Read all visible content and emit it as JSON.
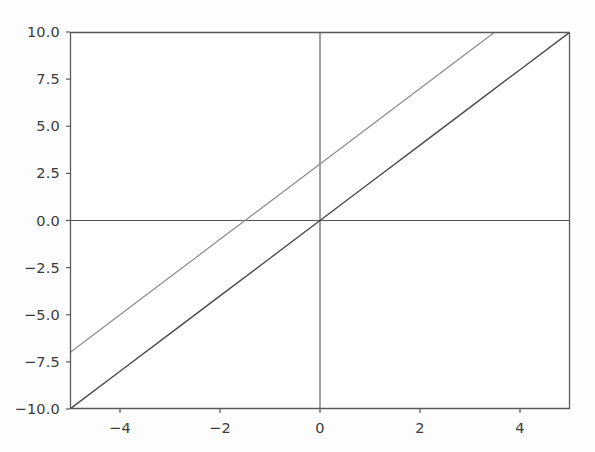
{
  "figure": {
    "background_color": "#fdfdfd",
    "plot_background_color": "#ffffff",
    "width_px": 595,
    "height_px": 452
  },
  "chart_data": {
    "type": "line",
    "title": "",
    "subtitle": "",
    "xlabel": "",
    "ylabel": "",
    "xlim": [
      -5,
      5
    ],
    "ylim": [
      -10,
      10
    ],
    "xticks": [
      -4,
      -2,
      0,
      2,
      4
    ],
    "xtick_labels": [
      "−4",
      "−2",
      "0",
      "2",
      "4"
    ],
    "yticks": [
      10,
      7.5,
      5,
      2.5,
      0,
      -2.5,
      -5,
      -7.5,
      -10
    ],
    "ytick_labels": [
      "10.0",
      "7.5",
      "5.0",
      "2.5",
      "0.0",
      "−2.5",
      "−5.0",
      "−7.5",
      "−10.0"
    ],
    "grid": false,
    "legend": null,
    "legend_position": "none",
    "axis_lines": {
      "vertical_at_x": 0,
      "horizontal_at_y": 0,
      "color": "#555555"
    },
    "series": [
      {
        "name": "y = 2x",
        "color": "#4a4a4a",
        "linewidth": 1.4,
        "equation": "y = 2*x",
        "slope": 2,
        "intercept": 0,
        "x": [
          -5,
          -4,
          -3,
          -2,
          -1,
          0,
          1,
          2,
          3,
          4,
          5
        ],
        "values": [
          -10,
          -8,
          -6,
          -4,
          -2,
          0,
          2,
          4,
          6,
          8,
          10
        ]
      },
      {
        "name": "y = 2x + 3",
        "color": "#8c8c8c",
        "linewidth": 1.2,
        "equation": "y = 2*x + 3",
        "slope": 2,
        "intercept": 3,
        "x": [
          -5,
          -4,
          -3,
          -2,
          -1,
          0,
          1,
          2,
          3,
          3.5
        ],
        "values": [
          -7,
          -5,
          -3,
          -1,
          1,
          3,
          5,
          7,
          9,
          10
        ]
      }
    ],
    "annotations": []
  },
  "axes_geometry": {
    "left_px": 70,
    "right_px": 570,
    "top_px": 32,
    "bottom_px": 409,
    "spine_color": "#5a5a5a",
    "tick_color": "#5a5a5a"
  }
}
